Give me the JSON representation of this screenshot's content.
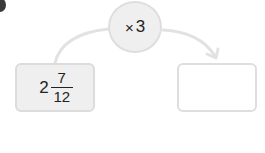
{
  "diagram": {
    "operator": {
      "symbol": "×",
      "operand": "3"
    },
    "start_value": {
      "whole": "2",
      "numerator": "7",
      "denominator": "12"
    },
    "result_value": "",
    "colors": {
      "box_fill": "#efefef",
      "box_border": "#dcdcdc",
      "connector": "#e2e2e2",
      "text": "#222222"
    }
  }
}
